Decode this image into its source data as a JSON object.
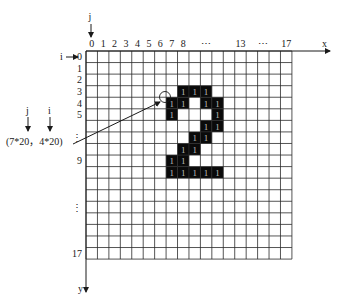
{
  "diagram": {
    "grid": {
      "rows": 18,
      "cols": 18,
      "origin_x": 86,
      "origin_y": 51,
      "cell_w": 11.44,
      "cell_h": 11.56,
      "line_color": "#2a2a2a",
      "fill_color": "#0a0a0a"
    },
    "axes": {
      "x_label": "x",
      "y_label": "y",
      "j_label": "j",
      "i_label": "i"
    },
    "column_labels": [
      {
        "col": 0,
        "text": "0"
      },
      {
        "col": 1,
        "text": "1"
      },
      {
        "col": 2,
        "text": "2"
      },
      {
        "col": 3,
        "text": "3"
      },
      {
        "col": 4,
        "text": "4"
      },
      {
        "col": 5,
        "text": "5"
      },
      {
        "col": 6,
        "text": "6"
      },
      {
        "col": 7,
        "text": "7"
      },
      {
        "col": 8,
        "text": "8"
      },
      {
        "col": 10,
        "text": "⋯"
      },
      {
        "col": 13,
        "text": "13"
      },
      {
        "col": 15,
        "text": "⋯"
      },
      {
        "col": 17,
        "text": "17"
      }
    ],
    "row_labels": [
      {
        "row": 0,
        "text": "0"
      },
      {
        "row": 1,
        "text": "1"
      },
      {
        "row": 2,
        "text": "2"
      },
      {
        "row": 3,
        "text": "3"
      },
      {
        "row": 4,
        "text": "4"
      },
      {
        "row": 5,
        "text": "5"
      },
      {
        "row": 7,
        "text": "⋮"
      },
      {
        "row": 9,
        "text": "9"
      },
      {
        "row": 13,
        "text": "⋮"
      },
      {
        "row": 17,
        "text": "17"
      }
    ],
    "filled_cells": [
      {
        "row": 3,
        "cols": [
          8,
          9,
          10
        ]
      },
      {
        "row": 4,
        "cols": [
          7,
          8,
          10,
          11
        ]
      },
      {
        "row": 5,
        "cols": [
          7,
          11
        ]
      },
      {
        "row": 6,
        "cols": [
          10,
          11
        ]
      },
      {
        "row": 7,
        "cols": [
          9,
          10
        ]
      },
      {
        "row": 8,
        "cols": [
          8,
          9
        ]
      },
      {
        "row": 9,
        "cols": [
          7,
          8
        ]
      },
      {
        "row": 10,
        "cols": [
          7,
          8,
          9,
          10,
          11
        ]
      }
    ],
    "cell_value": "1",
    "annotation": {
      "coordinate_text": "(7*20，4*20)",
      "j_marker": "j",
      "i_marker": "i",
      "circle_center": [
        165,
        97
      ],
      "circle_radius": 5.5
    }
  }
}
